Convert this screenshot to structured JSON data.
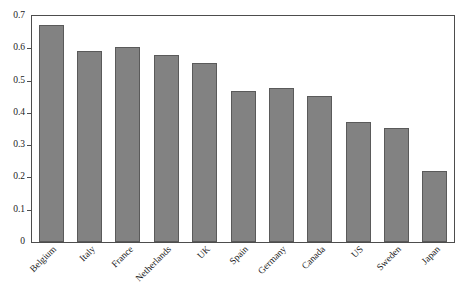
{
  "chart_data": {
    "type": "bar",
    "title": "",
    "subtitle": "",
    "xlabel": "",
    "ylabel": "",
    "categories": [
      "Belgium",
      "Italy",
      "France",
      "Netherlands",
      "UK",
      "Spain",
      "Germany",
      "Canada",
      "US",
      "Sweden",
      "Japan"
    ],
    "values": [
      0.672,
      0.593,
      0.605,
      0.578,
      0.553,
      0.468,
      0.478,
      0.453,
      0.373,
      0.353,
      0.221
    ],
    "ylim": [
      0,
      0.7
    ],
    "yticks": [
      0,
      0.1,
      0.2,
      0.3,
      0.4,
      0.5,
      0.6,
      0.7
    ],
    "ytick_labels": [
      "0",
      "0.1",
      "0.2",
      "0.3",
      "0.4",
      "0.5",
      "0.6",
      "0.7"
    ],
    "grid": false,
    "legend": null,
    "legend_position": "none",
    "bar_color": "#828282",
    "bar_edge_color": "#5a5a5a",
    "axis_color": "#4d4d4d",
    "background_color": "#ffffff",
    "xtick_label_rotation": -45
  }
}
